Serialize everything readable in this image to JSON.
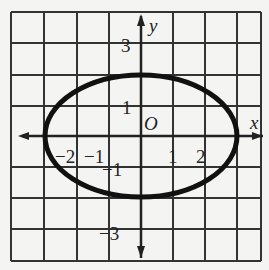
{
  "diagram": {
    "type": "ellipse-on-grid",
    "equation_shape": "ellipse centered at origin",
    "semi_axis_x": 3,
    "semi_axis_y": 2,
    "axes": {
      "x_label": "x",
      "y_label": "y",
      "origin_label": "O"
    },
    "x_tick_labels": [
      "−2",
      "−1",
      "1",
      "2"
    ],
    "y_tick_labels": [
      "3",
      "1",
      "−1",
      "−3"
    ],
    "grid": {
      "x_range": [
        -4,
        4
      ],
      "y_range": [
        -4,
        4
      ],
      "spacing": 1
    },
    "colors": {
      "grid": "#333333",
      "curve": "#111111",
      "background": "#f4f4f2"
    }
  }
}
